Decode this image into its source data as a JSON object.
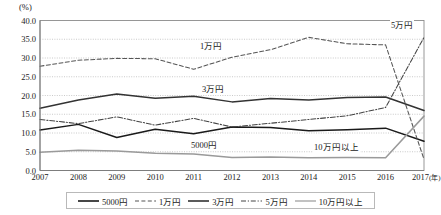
{
  "axis": {
    "unit": "(%)",
    "y_ticks": [
      "40.0",
      "35.0",
      "30.0",
      "25.0",
      "20.0",
      "15.0",
      "10.0",
      "5.0",
      "0.0"
    ],
    "x_ticks": [
      "2007",
      "2008",
      "2009",
      "2010",
      "2011",
      "2012",
      "2013",
      "2014",
      "2015",
      "2016",
      "2017"
    ],
    "x_last_unit": "(年)"
  },
  "annotations": {
    "ichiman": "1万円",
    "sanman": "3万円",
    "goman": "5万円",
    "gosen": "5000円",
    "juman": "10万円以上"
  },
  "legend": {
    "items": [
      {
        "label": "5000円",
        "style": "solid",
        "color": "#1a1a1a",
        "width": 1.6
      },
      {
        "label": "1万円",
        "style": "dashed",
        "color": "#555555",
        "width": 1.1
      },
      {
        "label": "3万円",
        "style": "solid",
        "color": "#333333",
        "width": 1.6
      },
      {
        "label": "5万円",
        "style": "dashdot",
        "color": "#444444",
        "width": 1.0
      },
      {
        "label": "10万円以上",
        "style": "solid",
        "color": "#9a9a9a",
        "width": 1.2
      }
    ]
  },
  "chart_data": {
    "type": "line",
    "title": "",
    "xlabel": "年",
    "ylabel": "(%)",
    "ylim": [
      0,
      40
    ],
    "ytick_step": 5,
    "grid": true,
    "legend_position": "bottom",
    "x": [
      2007,
      2008,
      2009,
      2010,
      2011,
      2012,
      2013,
      2014,
      2015,
      2016,
      2017
    ],
    "series": [
      {
        "name": "5000円",
        "style": "solid",
        "color": "#1a1a1a",
        "values": [
          10.8,
          12.3,
          8.8,
          11.0,
          9.8,
          11.6,
          11.5,
          10.6,
          10.9,
          11.3,
          7.8
        ]
      },
      {
        "name": "1万円",
        "style": "dashed",
        "color": "#555555",
        "values": [
          27.8,
          29.4,
          29.9,
          29.8,
          27.0,
          30.2,
          32.2,
          35.5,
          33.8,
          33.5,
          3.0
        ]
      },
      {
        "name": "3万円",
        "style": "solid",
        "color": "#333333",
        "values": [
          16.6,
          18.8,
          20.4,
          19.3,
          19.8,
          18.3,
          19.2,
          18.8,
          19.5,
          19.6,
          16.0
        ]
      },
      {
        "name": "5万円",
        "style": "dashdot",
        "color": "#444444",
        "values": [
          13.6,
          12.5,
          14.3,
          12.1,
          13.9,
          11.6,
          12.6,
          13.6,
          14.6,
          16.8,
          35.5
        ]
      },
      {
        "name": "10万円以上",
        "style": "solid",
        "color": "#9a9a9a",
        "values": [
          4.9,
          5.4,
          5.2,
          4.6,
          4.4,
          3.5,
          3.6,
          3.4,
          3.5,
          3.4,
          14.5
        ]
      }
    ]
  }
}
